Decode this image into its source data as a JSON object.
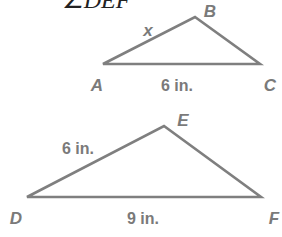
{
  "header_fragment": "∠DEF",
  "triangles": [
    {
      "name": "ABC",
      "vertices": {
        "A": {
          "label": "A",
          "x": 103,
          "y": 64,
          "lx": 97,
          "ly": 91
        },
        "B": {
          "label": "B",
          "x": 195,
          "y": 17,
          "lx": 210,
          "ly": 17
        },
        "C": {
          "label": "C",
          "x": 260,
          "y": 64,
          "lx": 270,
          "ly": 91
        }
      },
      "side_labels": {
        "AB": {
          "text": "x",
          "x": 148,
          "y": 36
        },
        "AC": {
          "text": "6 in.",
          "x": 177,
          "y": 91
        }
      }
    },
    {
      "name": "DEF",
      "vertices": {
        "D": {
          "label": "D",
          "x": 27,
          "y": 197,
          "lx": 16,
          "ly": 224
        },
        "E": {
          "label": "E",
          "x": 164,
          "y": 126,
          "lx": 183,
          "ly": 126
        },
        "F": {
          "label": "F",
          "x": 261,
          "y": 197,
          "lx": 274,
          "ly": 224
        }
      },
      "side_labels": {
        "DE": {
          "text": "6 in.",
          "x": 78,
          "y": 154
        },
        "DF": {
          "text": "9 in.",
          "x": 143,
          "y": 224
        }
      }
    }
  ],
  "colors": {
    "stroke": "#7f7f7f",
    "label": "#7a7a7a"
  }
}
